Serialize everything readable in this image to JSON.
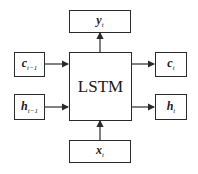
{
  "diagram": {
    "center": {
      "label": "LSTM"
    },
    "inputs": [
      {
        "id": "c_prev",
        "base": "c",
        "sub": "t−1"
      },
      {
        "id": "h_prev",
        "base": "h",
        "sub": "t−1"
      },
      {
        "id": "x",
        "base": "x",
        "sub": "t"
      }
    ],
    "outputs": [
      {
        "id": "y",
        "base": "y",
        "sub": "t"
      },
      {
        "id": "c",
        "base": "c",
        "sub": "t"
      },
      {
        "id": "h",
        "base": "h",
        "sub": "t"
      }
    ],
    "colors": {
      "line": "#2a2a2a",
      "background": "#ffffff"
    }
  }
}
